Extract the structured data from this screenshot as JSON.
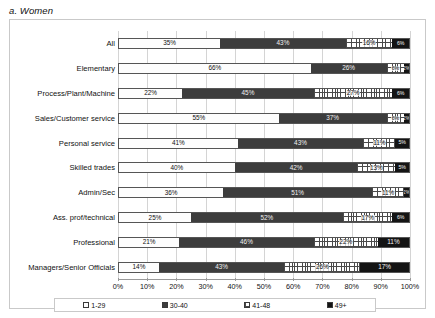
{
  "figure": {
    "caption": "a. Women"
  },
  "chart_data": {
    "type": "bar",
    "orientation": "horizontal",
    "stacked": true,
    "stack_mode": "percent",
    "title": "a. Women",
    "xlabel": "",
    "ylabel": "",
    "xlim": [
      0,
      100
    ],
    "xtick_labels": [
      "0%",
      "10%",
      "20%",
      "30%",
      "40%",
      "50%",
      "60%",
      "70%",
      "80%",
      "90%",
      "100%"
    ],
    "xtick_values": [
      0,
      10,
      20,
      30,
      40,
      50,
      60,
      70,
      80,
      90,
      100
    ],
    "grid": true,
    "legend_position": "bottom",
    "categories": [
      "All",
      "Elementary",
      "Process/Plant/Machine",
      "Sales/Customer service",
      "Personal service",
      "Skilled trades",
      "Admin/Sec",
      "Ass. prof/technical",
      "Professional",
      "Managers/Senior Officials"
    ],
    "series": [
      {
        "name": "1-29",
        "values": [
          35,
          66,
          22,
          55,
          41,
          40,
          36,
          25,
          21,
          14
        ]
      },
      {
        "name": "30-40",
        "values": [
          43,
          26,
          45,
          37,
          43,
          42,
          51,
          52,
          46,
          43
        ]
      },
      {
        "name": "41-48",
        "values": [
          16,
          6,
          27,
          6,
          11,
          13,
          11,
          17,
          22,
          26
        ]
      },
      {
        "name": "49+",
        "values": [
          6,
          2,
          6,
          2,
          5,
          5,
          2,
          6,
          11,
          17
        ]
      }
    ],
    "data_labels": [
      [
        "35%",
        "43%",
        "16%",
        "6%"
      ],
      [
        "66%",
        "26%",
        "6%",
        "2%"
      ],
      [
        "22%",
        "45%",
        "27%",
        "6%"
      ],
      [
        "55%",
        "37%",
        "6%",
        "2%"
      ],
      [
        "41%",
        "43%",
        "11%",
        "5%"
      ],
      [
        "40%",
        "42%",
        "13%",
        "5%"
      ],
      [
        "36%",
        "51%",
        "11%",
        "2%"
      ],
      [
        "25%",
        "52%",
        "17%",
        "6%"
      ],
      [
        "21%",
        "46%",
        "22%",
        "11%"
      ],
      [
        "14%",
        "43%",
        "26%",
        "17%"
      ]
    ],
    "label_visible_threshold": 8,
    "colors": {
      "series_1_29": "#fdfdfd",
      "series_30_40": "#3d3d3d",
      "series_41_48": "#ffffff",
      "series_49_plus": "#141414",
      "grid": "#d4d4d4",
      "axis": "#9a9a9a",
      "text": "#111111"
    }
  },
  "legend": {
    "items": [
      {
        "label": "1-29",
        "pattern": "dotted-light"
      },
      {
        "label": "30-40",
        "pattern": "solid-dark-gray"
      },
      {
        "label": "41-48",
        "pattern": "crosshatch"
      },
      {
        "label": "49+",
        "pattern": "solid-black"
      }
    ]
  }
}
